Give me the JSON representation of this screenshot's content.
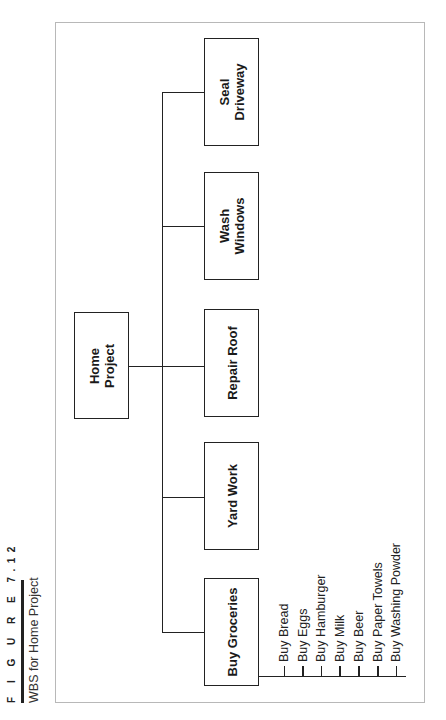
{
  "caption": {
    "figure_label": "F I G U R E  7.12",
    "title": "WBS for Home Project"
  },
  "wbs": {
    "root": {
      "label_line1": "Home",
      "label_line2": "Project"
    },
    "children": [
      {
        "label_line1": "Buy Groceries",
        "label_line2": ""
      },
      {
        "label_line1": "Yard Work",
        "label_line2": ""
      },
      {
        "label_line1": "Repair Roof",
        "label_line2": ""
      },
      {
        "label_line1": "Wash",
        "label_line2": "Windows"
      },
      {
        "label_line1": "Seal",
        "label_line2": "Driveway"
      }
    ],
    "groceries_items": [
      "Buy Bread",
      "Buy Eggs",
      "Buy Hamburger",
      "Buy Milk",
      "Buy Beer",
      "Buy Paper Towels",
      "Buy Washing Powder"
    ]
  }
}
